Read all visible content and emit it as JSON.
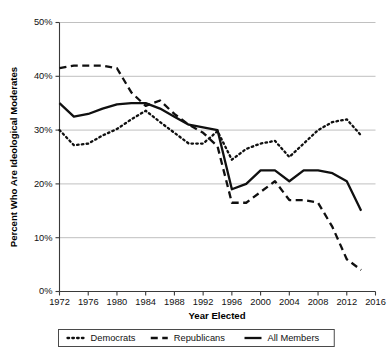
{
  "chart_data": {
    "type": "line",
    "title": "",
    "xlabel": "Year Elected",
    "ylabel": "Percent Who Are Ideological Moderates",
    "xlim": [
      1972,
      2016
    ],
    "ylim": [
      0,
      50
    ],
    "xticks": [
      1972,
      1976,
      1980,
      1984,
      1988,
      1992,
      1996,
      2000,
      2004,
      2008,
      2012,
      2016
    ],
    "xtick_labels": [
      "1972",
      "1976",
      "1980",
      "1984",
      "1988",
      "1992",
      "1996",
      "2000",
      "2004",
      "2008",
      "2012",
      "2016"
    ],
    "yticks": [
      0,
      10,
      20,
      30,
      40,
      50
    ],
    "ytick_labels": [
      "0%",
      "10%",
      "20%",
      "30%",
      "40%",
      "50%"
    ],
    "grid": "horizontal",
    "legend_position": "bottom",
    "x": [
      1972,
      1974,
      1976,
      1978,
      1980,
      1982,
      1984,
      1986,
      1988,
      1990,
      1992,
      1994,
      1996,
      1998,
      2000,
      2002,
      2004,
      2006,
      2008,
      2010,
      2012,
      2014
    ],
    "series": [
      {
        "name": "Democrats",
        "style": "dotted",
        "color": "#101010",
        "values": [
          30.0,
          27.2,
          27.5,
          29.0,
          30.2,
          32.0,
          33.6,
          31.5,
          29.5,
          27.5,
          27.5,
          29.8,
          24.5,
          26.5,
          27.5,
          28.0,
          25.0,
          27.5,
          30.0,
          31.5,
          32.0,
          29.0
        ]
      },
      {
        "name": "Republicans",
        "style": "dashed",
        "color": "#101010",
        "values": [
          41.5,
          42.0,
          42.0,
          42.0,
          41.5,
          37.0,
          34.5,
          35.5,
          33.0,
          31.0,
          29.5,
          27.0,
          16.5,
          16.5,
          18.5,
          20.5,
          17.0,
          17.0,
          16.5,
          12.0,
          6.0,
          4.0
        ]
      },
      {
        "name": "All Members",
        "style": "solid",
        "color": "#101010",
        "values": [
          35.0,
          32.5,
          33.0,
          34.0,
          34.8,
          35.0,
          35.0,
          34.0,
          32.5,
          31.0,
          30.5,
          30.0,
          19.0,
          20.0,
          22.5,
          22.5,
          20.5,
          22.5,
          22.5,
          22.0,
          20.5,
          15.0
        ]
      }
    ]
  },
  "legend": {
    "items": [
      {
        "label": "Democrats",
        "style": "dotted"
      },
      {
        "label": "Republicans",
        "style": "dashed"
      },
      {
        "label": "All Members",
        "style": "solid"
      }
    ]
  }
}
